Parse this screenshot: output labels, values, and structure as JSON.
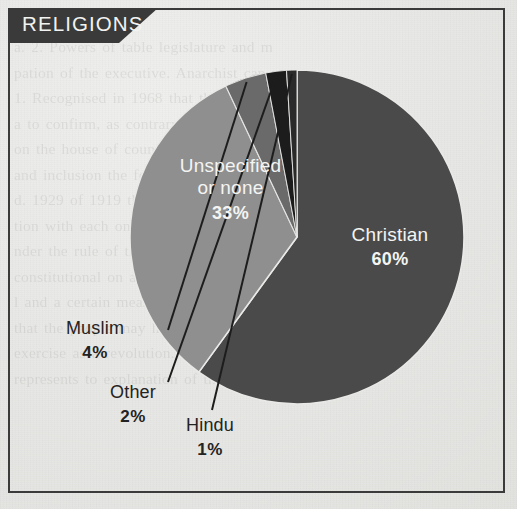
{
  "banner": {
    "title": "RELIGIONS"
  },
  "colors": {
    "background": "#e9e9e7",
    "frame": "#3b3b3b",
    "banner": "#3a3a3a",
    "banner_text": "#f2f2f0",
    "christian": "#4a4a4a",
    "unspecified": "#8f8f8f",
    "muslim": "#6a6a6a",
    "other": "#1c1c1c",
    "hindu": "#2a2a2a",
    "slice_divider": "#e9e9e7",
    "inside_label_text": "#f4f4f2",
    "outside_label_text": "#232323",
    "leader_line": "#1d1d1d"
  },
  "chart_data": {
    "type": "pie",
    "title": "RELIGIONS",
    "xlabel": "",
    "ylabel": "",
    "legend": "none-inline-labels",
    "start_angle_deg": 0,
    "direction": "clockwise",
    "categories": [
      "Christian",
      "Unspecified or none",
      "Muslim",
      "Other",
      "Hindu"
    ],
    "values": [
      60,
      33,
      4,
      2,
      1
    ],
    "units": "percent",
    "slices": [
      {
        "label": "Christian",
        "name_line1": "Christian",
        "name_line2": "",
        "value": 60,
        "pct_text": "60%",
        "color": "#4a4a4a",
        "label_placement": "inside"
      },
      {
        "label": "Unspecified or none",
        "name_line1": "Unspecified",
        "name_line2": "or none",
        "value": 33,
        "pct_text": "33%",
        "color": "#8f8f8f",
        "label_placement": "inside"
      },
      {
        "label": "Muslim",
        "name_line1": "Muslim",
        "name_line2": "",
        "value": 4,
        "pct_text": "4%",
        "color": "#6a6a6a",
        "label_placement": "outside"
      },
      {
        "label": "Other",
        "name_line1": "Other",
        "name_line2": "",
        "value": 2,
        "pct_text": "2%",
        "color": "#1c1c1c",
        "label_placement": "outside"
      },
      {
        "label": "Hindu",
        "name_line1": "Hindu",
        "name_line2": "",
        "value": 1,
        "pct_text": "1%",
        "color": "#2a2a2a",
        "label_placement": "outside"
      }
    ]
  },
  "ghost_page_text": [
    "a. 2. Powers of table legislature and m",
    "pation of the executive. Anarchist can o",
    "1. Recognised in 1968 that there is nothi",
    "a to confirm, as contrary to law or inconv",
    "on the house of councils. is made the fir",
    "and inclusion the federal or of the b",
    "d. 1929 of 1919 the which we have o",
    "tion with each one and of the consti",
    "nder the rule of the consent of the mo",
    "constitutional on a general condition",
    "l and a certain measure in the state",
    "that the people may have the right to",
    "exercise as a revolution. 2. and the",
    "represents to explanation of the seco"
  ]
}
